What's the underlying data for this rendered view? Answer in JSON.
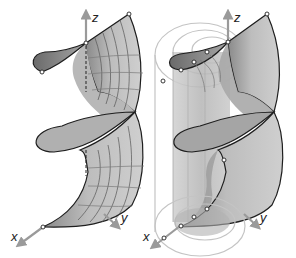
{
  "figure": {
    "type": "3D helicoid surface diagrams",
    "panels": [
      {
        "id": "left",
        "description": "Helicoid surface with parameter grid lines",
        "axes": {
          "x_label": "x",
          "y_label": "y",
          "z_label": "z"
        }
      },
      {
        "id": "right",
        "description": "Helicoid surface with coaxial construction cylinders and circles",
        "axes": {
          "x_label": "x",
          "y_label": "y",
          "z_label": "z"
        }
      }
    ]
  },
  "colors": {
    "surface_light": "#c8c8c8",
    "surface_mid": "#a9a9a9",
    "surface_dark": "#6e6e6e",
    "edge": "#1e1e1e",
    "grid": "#555555",
    "axis": "#9a9a9a",
    "construction": "#bdbdbd",
    "background": "#ffffff"
  }
}
